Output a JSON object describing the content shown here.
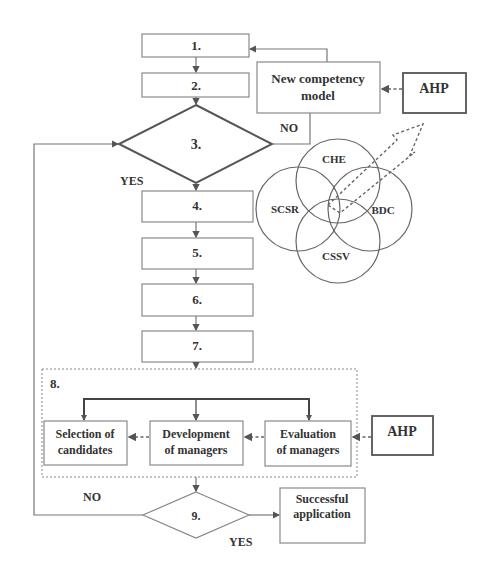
{
  "flowchart": {
    "steps": [
      {
        "id": "1",
        "label": "1."
      },
      {
        "id": "2",
        "label": "2."
      },
      {
        "id": "3",
        "label": "3."
      },
      {
        "id": "4",
        "label": "4."
      },
      {
        "id": "5",
        "label": "5."
      },
      {
        "id": "6",
        "label": "6."
      },
      {
        "id": "7",
        "label": "7."
      },
      {
        "id": "8",
        "label": "8."
      },
      {
        "id": "9",
        "label": "9."
      }
    ],
    "new_model": {
      "line1": "New competency",
      "line2": "model"
    },
    "ahp_top": "AHP",
    "ahp_bottom": "AHP",
    "decision3": {
      "yes": "YES",
      "no": "NO"
    },
    "decision9": {
      "yes": "YES",
      "no": "NO"
    },
    "step8_boxes": [
      {
        "line1": "Selection of",
        "line2": "candidates"
      },
      {
        "line1": "Development",
        "line2": "of managers"
      },
      {
        "line1": "Evaluation",
        "line2": "of managers"
      }
    ],
    "success": {
      "line1": "Successful",
      "line2": "application"
    },
    "venn": [
      "CHE",
      "SCSR",
      "BDC",
      "CSSV"
    ]
  }
}
